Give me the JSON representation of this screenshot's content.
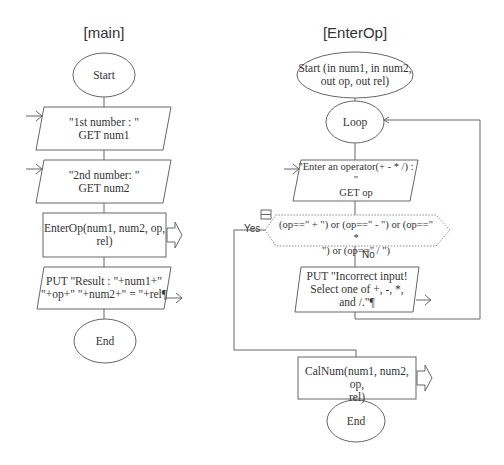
{
  "main": {
    "title": "[main]",
    "start": "Start",
    "input1": "\"1st number : \"\nGET num1",
    "input2": "\"2nd number: \"\nGET num2",
    "call": "EnterOp(num1,  num2,  op,\nrel)",
    "output": "PUT \"Result : \"+num1+\"\n\"+op+\" \"+num2+\" = \"+rel¶",
    "end": "End"
  },
  "enterop": {
    "title": "[EnterOp]",
    "start": "Start (in num1, in num2,\nout op, out rel)",
    "loop": "Loop",
    "input": "\"Enter an operator(+ - * /) :\n\"\nGET op",
    "decision": "(op==\" + \") or (op==\" - \") or (op==\" *\n\") or (op==\" / \")",
    "yes_label": "Yes",
    "no_label": "No",
    "error_output": "PUT \"Incorrect input!\nSelect one of +, -, *,\nand /.\"¶",
    "call": "CalNum(num1,  num2,  op,\nrel)",
    "end": "End"
  },
  "colors": {
    "stroke": "#666666",
    "text": "#333333",
    "background": "#ffffff"
  }
}
